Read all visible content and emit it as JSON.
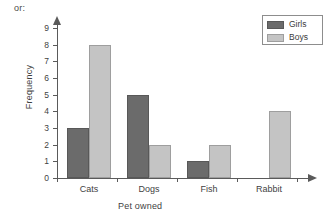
{
  "intro": {
    "text": "or:"
  },
  "legend": {
    "position": "top-right",
    "entries": [
      {
        "label": "Girls",
        "color": "#6b6b6b",
        "swatch_icon": "filled-square-dark"
      },
      {
        "label": "Boys",
        "color": "#c4c4c4",
        "swatch_icon": "filled-square-light"
      }
    ]
  },
  "chart_data": {
    "type": "bar",
    "title": "",
    "xlabel": "Pet owned",
    "ylabel": "Frequency",
    "categories": [
      "Cats",
      "Dogs",
      "Fish",
      "Rabbit"
    ],
    "series": [
      {
        "name": "Girls",
        "color": "#6b6b6b",
        "values": [
          3,
          5,
          1,
          0
        ]
      },
      {
        "name": "Boys",
        "color": "#c4c4c4",
        "values": [
          8,
          2,
          2,
          4
        ]
      }
    ],
    "ylim": [
      0,
      9
    ],
    "yticks": [
      0,
      1,
      2,
      3,
      4,
      5,
      6,
      7,
      8,
      9
    ],
    "ytick_labels": [
      "0",
      "1",
      "2",
      "3",
      "4",
      "5",
      "6",
      "7",
      "8",
      "9"
    ],
    "grid": false,
    "legend_position": "top-right",
    "axis_style": "arrow-ended"
  }
}
